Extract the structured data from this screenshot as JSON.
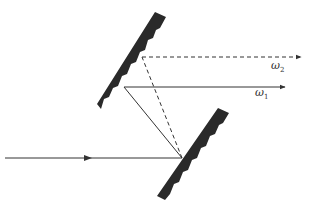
{
  "diagram": {
    "colors": {
      "grating": "#2a2a2a",
      "ray": "#333333",
      "background": "#ffffff"
    },
    "labels": {
      "omega2": {
        "symbol": "ω",
        "subscript": "2"
      },
      "omega1": {
        "symbol": "ω",
        "subscript": "1"
      }
    },
    "elements": [
      {
        "name": "incident-ray",
        "style": "solid",
        "from": [
          5,
          158
        ],
        "to": [
          182,
          158
        ]
      },
      {
        "name": "upper-grating",
        "from": [
          97,
          108
        ],
        "to": [
          165,
          12
        ]
      },
      {
        "name": "lower-grating",
        "from": [
          158,
          200
        ],
        "to": [
          228,
          108
        ]
      },
      {
        "name": "ray-omega1",
        "style": "solid"
      },
      {
        "name": "ray-omega2",
        "style": "dashed"
      }
    ]
  }
}
